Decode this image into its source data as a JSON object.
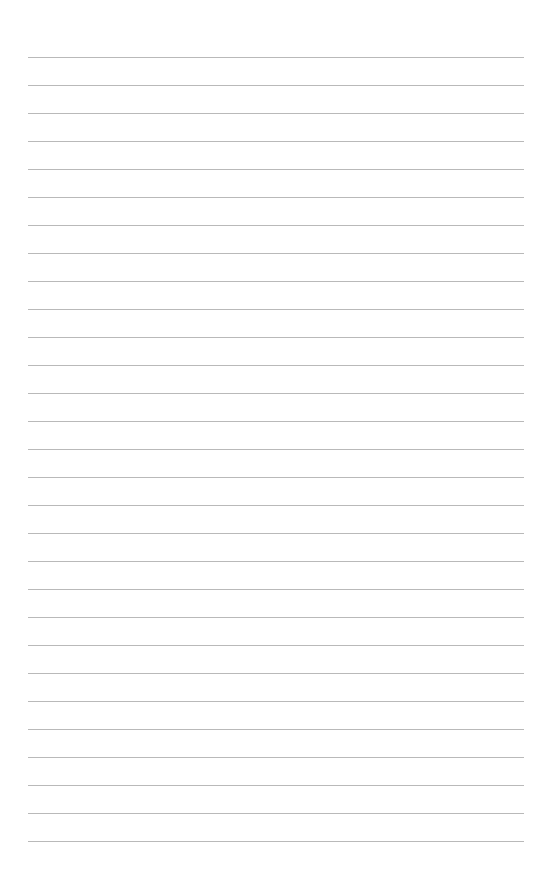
{
  "page": {
    "type": "lined-paper",
    "background_color": "#ffffff",
    "line_color": "#b9b9b9",
    "line_count": 29,
    "line_left": 28,
    "line_right": 524,
    "first_line_y": 57,
    "line_spacing": 28
  }
}
